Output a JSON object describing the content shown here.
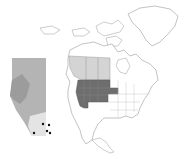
{
  "map": {
    "type": "range-map",
    "region": "North America",
    "inset_region": "Alberta",
    "colors": {
      "background": "#ffffff",
      "outline": "#9a9a9a",
      "range_light": "#d4d4d4",
      "range_dark": "#6e6e6e",
      "inset_high": "#9c9c9c",
      "inset_mid": "#b4b4b4",
      "inset_low": "#e4e4e4",
      "points": "#111111"
    },
    "inset_points": [
      {
        "x": 43,
        "y": 124
      },
      {
        "x": 49,
        "y": 125
      },
      {
        "x": 47,
        "y": 131
      },
      {
        "x": 34,
        "y": 133
      },
      {
        "x": 50,
        "y": 133
      }
    ]
  }
}
